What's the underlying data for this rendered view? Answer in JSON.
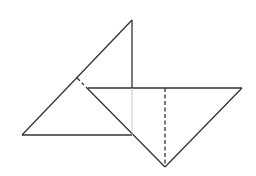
{
  "diagram": {
    "type": "geometric-figure",
    "colors": {
      "background": "#ffffff",
      "stroke": "#333333",
      "faint": "#bbbbbb"
    },
    "segments": [
      {
        "id": "upper-vertical",
        "x1": 132,
        "y1": 20,
        "x2": 132,
        "y2": 88,
        "style": "solid"
      },
      {
        "id": "left-hypotenuse",
        "x1": 132,
        "y1": 20,
        "x2": 22,
        "y2": 135,
        "style": "solid"
      },
      {
        "id": "left-base",
        "x1": 22,
        "y1": 135,
        "x2": 132,
        "y2": 135,
        "style": "solid"
      },
      {
        "id": "short-dash",
        "x1": 77,
        "y1": 78,
        "x2": 84,
        "y2": 85,
        "style": "dashed"
      },
      {
        "id": "diagonal",
        "x1": 86,
        "y1": 87,
        "x2": 165,
        "y2": 167,
        "style": "solid"
      },
      {
        "id": "top-edge",
        "x1": 88,
        "y1": 88,
        "x2": 242,
        "y2": 88,
        "style": "solid"
      },
      {
        "id": "right-edge",
        "x1": 242,
        "y1": 88,
        "x2": 165,
        "y2": 167,
        "style": "solid"
      },
      {
        "id": "center-dashed",
        "x1": 165,
        "y1": 88,
        "x2": 165,
        "y2": 167,
        "style": "dashed"
      },
      {
        "id": "faint-vertical",
        "x1": 132,
        "y1": 88,
        "x2": 132,
        "y2": 135,
        "style": "faint"
      }
    ]
  }
}
